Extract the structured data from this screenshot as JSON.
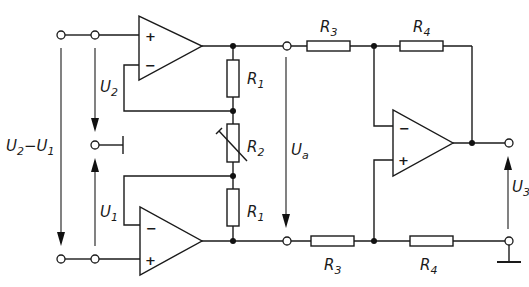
{
  "diagram": {
    "type": "instrumentation amplifier circuit",
    "components": {
      "R1_top": {
        "label": "R",
        "sub": "1"
      },
      "R1_bottom": {
        "label": "R",
        "sub": "1"
      },
      "R2": {
        "label": "R",
        "sub": "2",
        "variable": true
      },
      "R3_top": {
        "label": "R",
        "sub": "3"
      },
      "R3_bottom": {
        "label": "R",
        "sub": "3"
      },
      "R4_top": {
        "label": "R",
        "sub": "4"
      },
      "R4_bottom": {
        "label": "R",
        "sub": "4"
      }
    },
    "opamps": {
      "top": {
        "plus": "+",
        "minus": "−"
      },
      "bottom": {
        "plus": "+",
        "minus": "−"
      },
      "output": {
        "plus": "+",
        "minus": "−"
      }
    },
    "voltages": {
      "diff": {
        "a": "U",
        "a_sub": "2",
        "dash": "−",
        "b": "U",
        "b_sub": "1"
      },
      "U2": {
        "label": "U",
        "sub": "2"
      },
      "U1": {
        "label": "U",
        "sub": "1"
      },
      "Ua": {
        "label": "U",
        "sub": "a"
      },
      "U3": {
        "label": "U",
        "sub": "3"
      }
    }
  }
}
